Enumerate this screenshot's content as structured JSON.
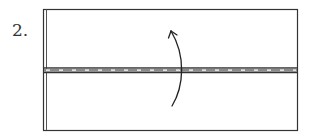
{
  "diagram": {
    "step_label": "2.",
    "type": "origami-fold-step",
    "colors": {
      "line": "#333333",
      "paper": "#ffffff"
    },
    "elements": {
      "paper": "rectangle",
      "fold_line": "valley-fold-dashed",
      "arrow": "fold-up-curved-arrow"
    }
  }
}
